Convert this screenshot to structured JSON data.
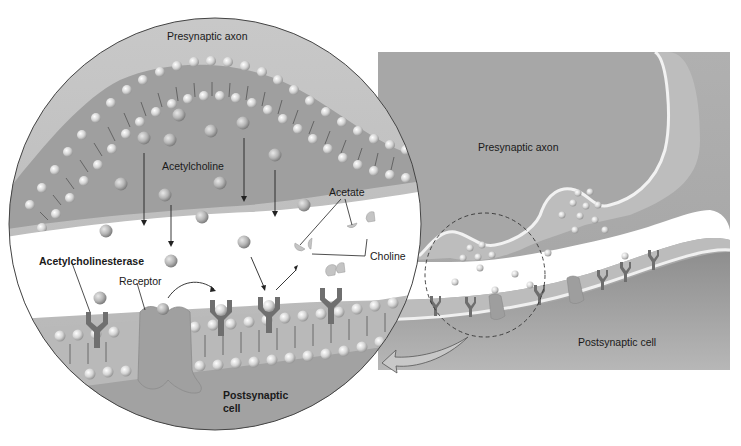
{
  "colors": {
    "background": "#ffffff",
    "cell_gray": "#a9a9a9",
    "cell_dark": "#8f8f8f",
    "cleft": "#ffffff",
    "membrane_head": "#e6e6e6",
    "protein": "#7a7a7a",
    "outline": "#333333"
  },
  "labels": {
    "inset_presynaptic": "Presynaptic axon",
    "acetylcholine": "Acetylcholine",
    "acetate": "Acetate",
    "choline": "Choline",
    "acetylcholinesterase": "Acetylcholinesterase",
    "receptor": "Receptor",
    "inset_postsynaptic_line1": "Postsynaptic",
    "inset_postsynaptic_line2": "cell",
    "overview_presynaptic": "Presynaptic axon",
    "overview_postsynaptic": "Postsynaptic cell"
  }
}
